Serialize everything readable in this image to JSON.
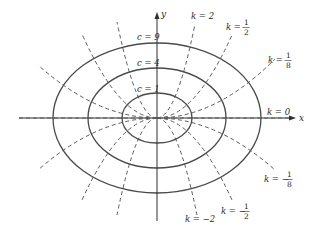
{
  "figure": {
    "width": 314,
    "height": 234,
    "origin": {
      "x": 157,
      "y": 118
    },
    "colors": {
      "ellipse": "#4a4a4a",
      "trajectory": "#5a5a5a",
      "axis": "#2e2e2e",
      "text": "#2a2a2a",
      "background": "#ffffff"
    }
  },
  "axes": {
    "x_label": "x",
    "y_label": "y"
  },
  "level_curves": [
    {
      "label": "c = 9",
      "c": 9,
      "rx": 104,
      "ry": 75,
      "label_x": 137,
      "label_y": 40
    },
    {
      "label": "c = 4",
      "c": 4,
      "rx": 69,
      "ry": 50,
      "label_x": 137,
      "label_y": 65
    },
    {
      "label": "c = 1",
      "c": 1,
      "rx": 35,
      "ry": 25,
      "label_x": 136,
      "label_y": 92
    }
  ],
  "trajectories": [
    {
      "k": "2",
      "label_k": "2",
      "dx": 38,
      "dy": 94
    },
    {
      "k": "1/2",
      "label_k_num": "1",
      "label_k_den": "2",
      "dx": 75,
      "dy": 83
    },
    {
      "k": "1/8",
      "label_k_num": "1",
      "label_k_den": "8",
      "dx": 118,
      "dy": 56
    },
    {
      "k": "0",
      "label_k": "0",
      "dx": 138,
      "dy": 0
    },
    {
      "k": "-1/8",
      "label_k_num": "1",
      "label_k_den": "8",
      "dx": 118,
      "dy": -52
    },
    {
      "k": "-1/2",
      "label_k_num": "1",
      "label_k_den": "2",
      "dx": 75,
      "dy": -82
    },
    {
      "k": "-2",
      "label_k": "−2",
      "dx": 40,
      "dy": -97
    }
  ],
  "labels": {
    "k_prefix": "k",
    "equals": " = ",
    "minus": "−",
    "c9": "c = 9",
    "c4": "c = 4",
    "c1": "c = 1",
    "k2": "k = 2",
    "k0": "k = 0",
    "km2": "k = −2",
    "frac_half_num": "1",
    "frac_half_den": "2",
    "frac_eighth_num": "1",
    "frac_eighth_den": "8"
  }
}
